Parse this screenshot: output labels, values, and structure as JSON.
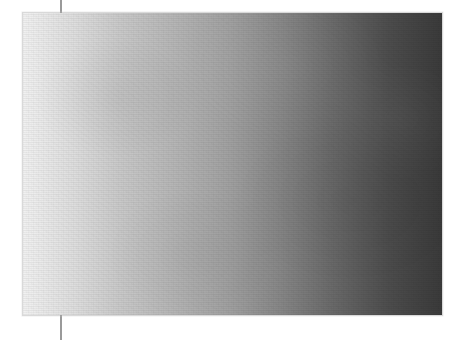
{
  "canvas": {
    "width": 465,
    "height": 340,
    "background_color": "#ffffff"
  },
  "guide_line": {
    "label": "vertical guide line",
    "x": 60,
    "thickness": 2,
    "color": "#9a9a9a",
    "extends_full_height": true
  },
  "gradient_swatch": {
    "label": "horizontal grayscale gradient swatch",
    "x": 22,
    "y": 12,
    "width": 421,
    "height": 304,
    "direction": "left-to-right",
    "border_color": "#aaaaaa",
    "texture": "subtle paper grain"
  },
  "chart_data": {
    "type": "heatmap",
    "title": "",
    "subtitle": "",
    "xlabel": "",
    "ylabel": "",
    "grid": false,
    "legend_position": "none",
    "orientation": "horizontal",
    "colorbar": {
      "label": "",
      "tick_labels": [],
      "min_value": 0,
      "max_value": 100
    },
    "stops": [
      {
        "position": 0,
        "x_px": 22,
        "color": "#f1f1f1",
        "gray_level": 241
      },
      {
        "position": 12,
        "x_px": 73,
        "color": "#dedede",
        "gray_level": 222
      },
      {
        "position": 23,
        "x_px": 120,
        "color": "#c9c9c9",
        "gray_level": 201
      },
      {
        "position": 37,
        "x_px": 178,
        "color": "#b4b4b4",
        "gray_level": 180
      },
      {
        "position": 49,
        "x_px": 230,
        "color": "#a1a1a1",
        "gray_level": 161
      },
      {
        "position": 62,
        "x_px": 283,
        "color": "#858585",
        "gray_level": 133
      },
      {
        "position": 73,
        "x_px": 330,
        "color": "#6b6b6b",
        "gray_level": 107
      },
      {
        "position": 87,
        "x_px": 388,
        "color": "#4d4d4d",
        "gray_level": 77
      },
      {
        "position": 100,
        "x_px": 443,
        "color": "#3a3a3a",
        "gray_level": 58
      }
    ],
    "x": [
      22,
      73,
      120,
      178,
      230,
      283,
      330,
      388,
      443
    ],
    "values": [
      241,
      222,
      201,
      180,
      161,
      133,
      107,
      77,
      58
    ],
    "xlim": [
      22,
      443
    ],
    "ylim": [
      0,
      255
    ]
  }
}
